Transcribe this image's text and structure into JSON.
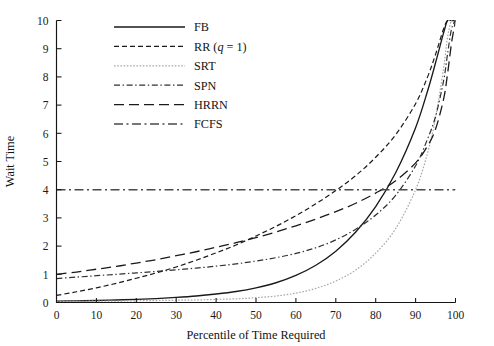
{
  "figure": {
    "title": "",
    "background": "#ffffff",
    "width": 494,
    "height": 346
  },
  "axes": {
    "x_title": "Percentile of Time Required",
    "y_title": "Wait Time",
    "x_ticks": [
      "0",
      "10",
      "20",
      "30",
      "40",
      "50",
      "60",
      "70",
      "80",
      "90",
      "100"
    ],
    "y_ticks": [
      "0",
      "1",
      "2",
      "3",
      "4",
      "5",
      "6",
      "7",
      "8",
      "9",
      "10"
    ],
    "x_range": [
      0,
      100
    ],
    "y_range": [
      0,
      10
    ],
    "grid": "off",
    "frame": "left-and-bottom",
    "axis_color": "#151515"
  },
  "legend": {
    "position": "top-center-left",
    "entries": [
      {
        "key": "FB",
        "label": "FB",
        "label_html": "FB",
        "color": "#1a1a1a",
        "width": 1.35,
        "dash": "none",
        "dasharray": ""
      },
      {
        "key": "RR",
        "label": "RR (q = 1)",
        "label_html": "RR (<i>q</i> = 1)",
        "color": "#1a1a1a",
        "width": 1.2,
        "dash": "dashed",
        "dasharray": "5,3"
      },
      {
        "key": "SRT",
        "label": "SRT",
        "label_html": "SRT",
        "color": "#a8a8a8",
        "width": 1.2,
        "dash": "dotted",
        "dasharray": "1.6,1.6"
      },
      {
        "key": "SPN",
        "label": "SPN",
        "label_html": "SPN",
        "color": "#303030",
        "width": 1.2,
        "dash": "dash-dot",
        "dasharray": "6,2.6,1.4,2.6"
      },
      {
        "key": "HRRN",
        "label": "HRRN",
        "label_html": "HRRN",
        "color": "#1a1a1a",
        "width": 1.3,
        "dash": "long-dash",
        "dasharray": "10,5"
      },
      {
        "key": "FCFS",
        "label": "FCFS",
        "label_html": "FCFS",
        "color": "#4a4a4a",
        "width": 1.4,
        "dash": "dash-dot",
        "dasharray": "9,3.5,2,3.5"
      }
    ]
  },
  "chart_data": {
    "type": "line",
    "title": "",
    "xlabel": "Percentile of Time Required",
    "ylabel": "Wait Time",
    "xlim": [
      0,
      100
    ],
    "ylim": [
      0,
      10
    ],
    "xticks": [
      0,
      10,
      20,
      30,
      40,
      50,
      60,
      70,
      80,
      90,
      100
    ],
    "yticks": [
      0,
      1,
      2,
      3,
      4,
      5,
      6,
      7,
      8,
      9,
      10
    ],
    "grid": false,
    "legend_position": "upper left-center",
    "x": [
      0,
      5,
      10,
      15,
      20,
      25,
      30,
      35,
      40,
      45,
      50,
      55,
      60,
      65,
      70,
      75,
      80,
      85,
      90,
      93,
      95,
      97,
      98,
      99,
      100
    ],
    "series": [
      {
        "name": "FB",
        "style": "solid",
        "color": "#1a1a1a",
        "values": [
          0.05,
          0.06,
          0.07,
          0.09,
          0.11,
          0.14,
          0.18,
          0.23,
          0.3,
          0.39,
          0.52,
          0.7,
          0.96,
          1.32,
          1.82,
          2.5,
          3.4,
          4.6,
          6.2,
          7.5,
          8.5,
          9.55,
          10.0,
          10.0,
          10.0
        ]
      },
      {
        "name": "RR (q = 1)",
        "style": "dashed",
        "color": "#1a1a1a",
        "values": [
          0.25,
          0.38,
          0.52,
          0.68,
          0.86,
          1.05,
          1.26,
          1.5,
          1.76,
          2.04,
          2.36,
          2.7,
          3.08,
          3.5,
          3.97,
          4.5,
          5.15,
          5.95,
          7.05,
          8.0,
          8.8,
          9.7,
          10.0,
          10.0,
          10.0
        ]
      },
      {
        "name": "SRT",
        "style": "dotted",
        "color": "#a8a8a8",
        "values": [
          0.04,
          0.04,
          0.05,
          0.05,
          0.06,
          0.07,
          0.08,
          0.09,
          0.11,
          0.13,
          0.17,
          0.23,
          0.33,
          0.5,
          0.76,
          1.15,
          1.75,
          2.62,
          4.0,
          5.3,
          6.55,
          8.3,
          9.4,
          10.0,
          10.0
        ]
      },
      {
        "name": "SPN",
        "style": "dash-dot",
        "color": "#303030",
        "values": [
          0.85,
          0.9,
          0.95,
          1.0,
          1.05,
          1.1,
          1.16,
          1.22,
          1.29,
          1.37,
          1.47,
          1.59,
          1.74,
          1.94,
          2.22,
          2.6,
          3.1,
          3.8,
          4.85,
          5.8,
          6.6,
          7.85,
          8.8,
          9.7,
          10.0
        ]
      },
      {
        "name": "HRRN",
        "style": "long-dash",
        "color": "#1a1a1a",
        "values": [
          1.0,
          1.08,
          1.18,
          1.28,
          1.4,
          1.52,
          1.66,
          1.8,
          1.96,
          2.12,
          2.3,
          2.5,
          2.72,
          2.96,
          3.22,
          3.52,
          3.88,
          4.32,
          4.95,
          5.55,
          6.15,
          7.2,
          8.1,
          9.2,
          10.0
        ]
      },
      {
        "name": "FCFS",
        "style": "dash-dot",
        "color": "#4a4a4a",
        "constant": 4,
        "values": [
          4,
          4,
          4,
          4,
          4,
          4,
          4,
          4,
          4,
          4,
          4,
          4,
          4,
          4,
          4,
          4,
          4,
          4,
          4,
          4,
          4,
          4,
          4,
          4,
          4
        ]
      }
    ]
  }
}
